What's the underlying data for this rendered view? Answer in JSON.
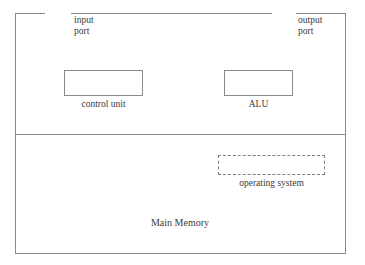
{
  "diagram": {
    "cpu_section": {
      "input_port": "input\nport",
      "input_port_line_1": "input",
      "input_port_line_2": "port",
      "output_port_line_1": "output",
      "output_port_line_2": "port",
      "components": [
        {
          "id": "control-unit",
          "label": "control unit",
          "style": "solid"
        },
        {
          "id": "alu",
          "label": "ALU",
          "style": "solid"
        }
      ]
    },
    "memory_section": {
      "label": "Main Memory",
      "components": [
        {
          "id": "operating-system",
          "label": "operating system",
          "style": "dashed"
        }
      ]
    },
    "colors": {
      "line": "#8a8a8a",
      "dashed_line": "#7d7d7d",
      "text": "#3a3a3a",
      "background": "#ffffff"
    }
  }
}
